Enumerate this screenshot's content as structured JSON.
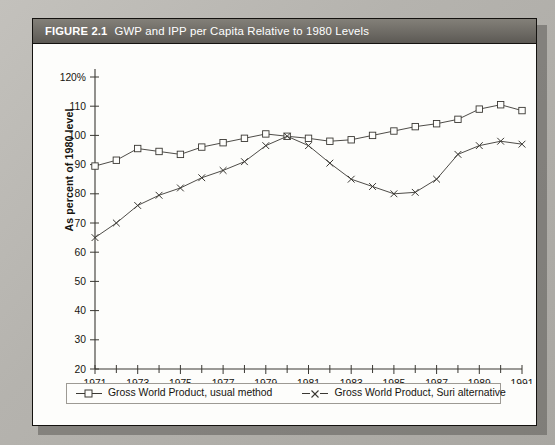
{
  "figure": {
    "number_label": "FIGURE 2.1",
    "caption": "GWP and IPP per Capita Relative to 1980 Levels"
  },
  "colors": {
    "page_background": "#b9b7b2",
    "card_background": "#fdfdfb",
    "titlebar": "#6e6b65",
    "titlebar_text": "#ffffff",
    "axis": "#3a3833",
    "series_usual": "#3a3833",
    "series_suri": "#3a3833",
    "legend_border": "#9d9a94"
  },
  "legend": {
    "entries": [
      {
        "key": "open-square-marker",
        "label": "Gross World Product, usual method"
      },
      {
        "key": "cross-marker",
        "label": "Gross World Product, Suri alternative"
      }
    ]
  },
  "chart_data": {
    "type": "line",
    "title": "GWP and IPP per Capita Relative to 1980 Levels",
    "xlabel": "",
    "ylabel": "As percent of 1980 level",
    "x": [
      1971,
      1972,
      1973,
      1974,
      1975,
      1976,
      1977,
      1978,
      1979,
      1980,
      1981,
      1982,
      1983,
      1984,
      1985,
      1986,
      1987,
      1988,
      1989,
      1990,
      1991
    ],
    "xlim": [
      1971,
      1991
    ],
    "ylim": [
      20,
      120
    ],
    "ytick_values": [
      20,
      30,
      40,
      50,
      60,
      70,
      80,
      90,
      100,
      110,
      120
    ],
    "ytick_labels": [
      "20",
      "30",
      "40",
      "50",
      "60",
      "70",
      "80",
      "90",
      "100",
      "110",
      "120%"
    ],
    "xtick_values": [
      1971,
      1973,
      1975,
      1977,
      1979,
      1981,
      1983,
      1985,
      1987,
      1989,
      1991
    ],
    "xtick_labels": [
      "1971",
      "1973",
      "1975",
      "1977",
      "1979",
      "1981",
      "1983",
      "1985",
      "1987",
      "1989",
      "1991"
    ],
    "xtick_minor_values": [
      1972,
      1974,
      1976,
      1978,
      1980,
      1982,
      1984,
      1986,
      1988,
      1990
    ],
    "grid": false,
    "legend_position": "below-axes",
    "series": [
      {
        "name": "Gross World Product, usual method",
        "marker": "open-square",
        "values": [
          89.5,
          91.5,
          95.5,
          94.5,
          93.5,
          96.0,
          97.5,
          99.0,
          100.5,
          99.7,
          99.0,
          98.0,
          98.5,
          100.0,
          101.5,
          103.0,
          104.0,
          105.5,
          109.0,
          110.5,
          108.5
        ]
      },
      {
        "name": "Gross World Product, Suri alternative",
        "marker": "cross",
        "values": [
          65.0,
          70.0,
          76.0,
          79.5,
          82.0,
          85.5,
          88.0,
          91.0,
          96.5,
          99.7,
          96.5,
          90.5,
          85.0,
          82.5,
          80.0,
          80.5,
          85.0,
          93.5,
          96.5,
          98.0,
          97.0
        ]
      }
    ]
  }
}
